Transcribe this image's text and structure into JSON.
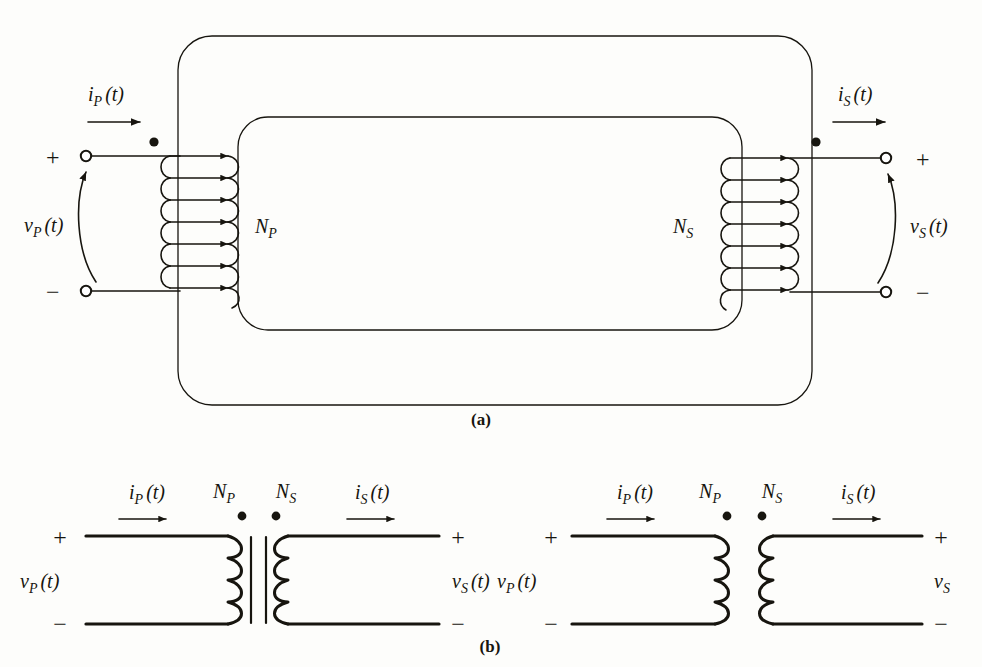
{
  "figure": {
    "background_color": "#fdfdfb",
    "ink_color": "#17150f",
    "panels": [
      {
        "id": "a",
        "caption": "(a)",
        "description": "Sketch of transformer windings on a ferromagnetic core"
      },
      {
        "id": "b",
        "caption": "(b)",
        "description": "Schematic symbols of transformer"
      }
    ]
  },
  "panel_a": {
    "caption": "(a)",
    "primary": {
      "current_label": {
        "var": "i",
        "sub": "P",
        "arg": "(t)"
      },
      "voltage_label": {
        "var": "v",
        "sub": "P",
        "arg": "(t)"
      },
      "turns_label": {
        "var": "N",
        "sub": "P"
      },
      "plus_sign": "+",
      "minus_sign": "−",
      "turns_drawn": 7,
      "dot_marking": "polarity-dot"
    },
    "secondary": {
      "current_label": {
        "var": "i",
        "sub": "S",
        "arg": "(t)"
      },
      "voltage_label": {
        "var": "v",
        "sub": "S",
        "arg": "(t)"
      },
      "turns_label": {
        "var": "N",
        "sub": "S"
      },
      "plus_sign": "+",
      "minus_sign": "−",
      "turns_drawn": 7,
      "dot_marking": "polarity-dot"
    }
  },
  "panel_b": {
    "caption": "(b)",
    "left_symbol": {
      "has_core_bars": true,
      "primary": {
        "current_label": {
          "var": "i",
          "sub": "P",
          "arg": "(t)"
        },
        "voltage_label": {
          "var": "v",
          "sub": "P",
          "arg": "(t)"
        },
        "turns_label": {
          "var": "N",
          "sub": "P"
        },
        "plus_sign": "+",
        "minus_sign": "−"
      },
      "secondary": {
        "current_label": {
          "var": "i",
          "sub": "S",
          "arg": "(t)"
        },
        "voltage_label": {
          "var": "v",
          "sub": "S",
          "arg": "(t)"
        },
        "turns_label": {
          "var": "N",
          "sub": "S"
        },
        "plus_sign": "+",
        "minus_sign": "−"
      }
    },
    "right_symbol": {
      "has_core_bars": false,
      "primary": {
        "current_label": {
          "var": "i",
          "sub": "P",
          "arg": "(t)"
        },
        "voltage_label": {
          "var": "v",
          "sub": "P",
          "arg": "(t)"
        },
        "turns_label": {
          "var": "N",
          "sub": "P"
        },
        "plus_sign": "+",
        "minus_sign": "−"
      },
      "secondary": {
        "current_label": {
          "var": "i",
          "sub": "S",
          "arg": "(t)"
        },
        "voltage_label": {
          "var": "v",
          "sub": "S",
          "arg": ""
        },
        "turns_label": {
          "var": "N",
          "sub": "S"
        },
        "plus_sign": "+",
        "minus_sign": "−"
      }
    }
  }
}
